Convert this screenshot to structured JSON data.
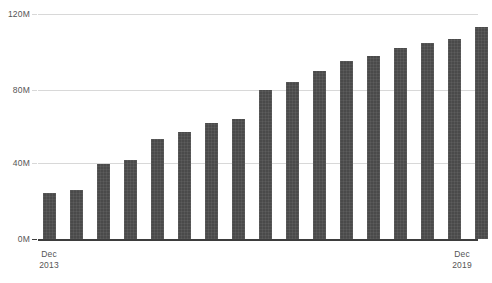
{
  "chart_data": {
    "type": "bar",
    "title": "",
    "subtitle": "",
    "xlabel": "",
    "ylabel": "",
    "ylim": [
      0,
      120000000
    ],
    "yticks": [
      0,
      40000000,
      80000000,
      120000000
    ],
    "ytick_labels": [
      "0M",
      "40M",
      "80M",
      "120M"
    ],
    "grid": true,
    "legend": null,
    "bar_color": "#4a4a4a",
    "gridline_color": "#d8d8d8",
    "axis_color": "#3d3d3d",
    "categories": [
      "Dec 2013",
      "Jun 2014",
      "Dec 2014",
      "Jun 2015",
      "Dec 2015",
      "Jun 2016",
      "Dec 2016",
      "Jun 2017",
      "Dec 2017",
      "Jun 2018",
      "Dec 2018",
      "Jun 2019",
      "Dec 2019",
      "Jun 2020",
      "Dec 2020",
      "Jun 2021",
      "Dec 2021"
    ],
    "values": [
      24500000,
      26000000,
      40000000,
      42000000,
      53500000,
      57000000,
      62000000,
      64000000,
      79500000,
      84000000,
      89500000,
      95000000,
      97500000,
      102000000,
      104500000,
      106500000,
      113000000
    ],
    "value_labels": [
      "24.5M",
      "26M",
      "40M",
      "42M",
      "53.5M",
      "57M",
      "62M",
      "64M",
      "79.5M",
      "84M",
      "89.5M",
      "95M",
      "97.5M",
      "102M",
      "104.5M",
      "106.5M",
      "113M"
    ],
    "xtick_labels": [
      {
        "line1": "Dec",
        "line2": "2013"
      },
      {
        "line1": "Dec",
        "line2": "2019"
      }
    ]
  }
}
